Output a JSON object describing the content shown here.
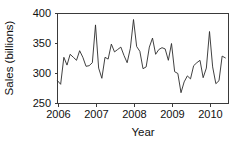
{
  "chart_data": {
    "type": "line",
    "title": "",
    "xlabel": "Year",
    "ylabel": "Sales (billions)",
    "ylim": [
      250,
      400
    ],
    "xlim": [
      2006,
      2010.5
    ],
    "yticks": [
      250,
      300,
      350,
      400
    ],
    "ytick_labels": [
      "250",
      "300",
      "350",
      "400"
    ],
    "xticks": [
      2006,
      2007,
      2008,
      2009,
      2010
    ],
    "xtick_labels": [
      "2006",
      "2007",
      "2008",
      "2009",
      "2010"
    ],
    "grid": false,
    "legend": null,
    "line_color": "#2b2b2b",
    "frame_color": "#3a3a3a",
    "series": [
      {
        "name": "Sales",
        "x": [
          2006.0,
          2006.083,
          2006.167,
          2006.25,
          2006.333,
          2006.417,
          2006.5,
          2006.583,
          2006.667,
          2006.75,
          2006.833,
          2006.917,
          2007.0,
          2007.083,
          2007.167,
          2007.25,
          2007.333,
          2007.417,
          2007.5,
          2007.583,
          2007.667,
          2007.75,
          2007.833,
          2007.917,
          2008.0,
          2008.083,
          2008.167,
          2008.25,
          2008.333,
          2008.417,
          2008.5,
          2008.583,
          2008.667,
          2008.75,
          2008.833,
          2008.917,
          2009.0,
          2009.083,
          2009.167,
          2009.25,
          2009.333,
          2009.417,
          2009.5,
          2009.583,
          2009.667,
          2009.75,
          2009.833,
          2009.917,
          2010.0,
          2010.083,
          2010.167,
          2010.25,
          2010.333,
          2010.417
        ],
        "values": [
          288,
          282,
          327,
          314,
          332,
          327,
          322,
          338,
          327,
          312,
          313,
          318,
          381,
          309,
          292,
          327,
          324,
          349,
          336,
          340,
          344,
          330,
          318,
          342,
          390,
          345,
          337,
          308,
          311,
          344,
          359,
          332,
          340,
          343,
          341,
          322,
          350,
          303,
          300,
          268,
          286,
          296,
          291,
          313,
          318,
          322,
          293,
          309,
          370,
          311,
          283,
          288,
          329,
          326
        ]
      }
    ]
  }
}
